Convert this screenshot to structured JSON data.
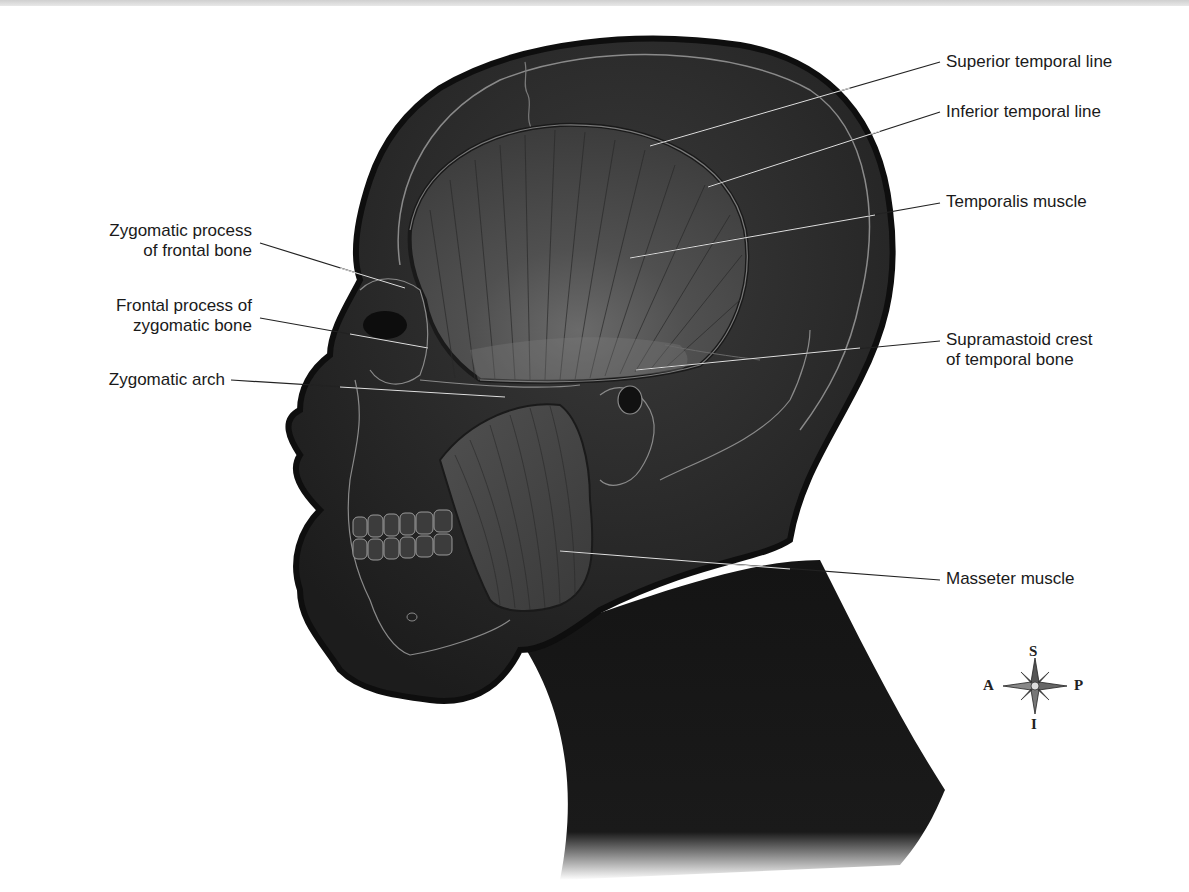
{
  "figure": {
    "colors": {
      "background": "#ffffff",
      "silhouette": "#141414",
      "head_fill": "#2c2c2c",
      "muscle_fill": "#4a4a4a",
      "outline": "#9a9a9a",
      "leader_line": "#222222",
      "label_text": "#1a1a1a"
    }
  },
  "labels": {
    "left": [
      {
        "id": "zygomatic-process-frontal",
        "line1": "Zygomatic process",
        "line2": "of frontal bone"
      },
      {
        "id": "frontal-process-zygomatic",
        "line1": "Frontal process of",
        "line2": "zygomatic bone"
      },
      {
        "id": "zygomatic-arch",
        "line1": "Zygomatic arch",
        "line2": ""
      }
    ],
    "right": [
      {
        "id": "superior-temporal-line",
        "line1": "Superior temporal line",
        "line2": ""
      },
      {
        "id": "inferior-temporal-line",
        "line1": "Inferior temporal line",
        "line2": ""
      },
      {
        "id": "temporalis-muscle",
        "line1": "Temporalis muscle",
        "line2": ""
      },
      {
        "id": "supramastoid-crest",
        "line1": "Supramastoid crest",
        "line2": "of temporal bone"
      },
      {
        "id": "masseter-muscle",
        "line1": "Masseter muscle",
        "line2": ""
      }
    ]
  },
  "compass": {
    "top": "S",
    "bottom": "I",
    "left": "A",
    "right": "P"
  }
}
